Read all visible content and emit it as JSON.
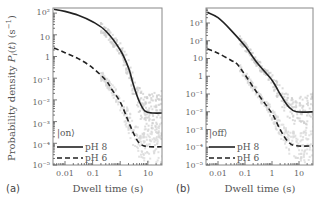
{
  "figure": {
    "ylabel": "Probability density P_i(t) (s^-1)",
    "xlabel": "Dwell time (s)"
  },
  "chart_data": [
    {
      "type": "line",
      "panel_label": "(a)",
      "title": "",
      "state_label": "|on⟩",
      "xlabel": "Dwell time (s)",
      "ylabel": "Probability density P_i(t) (s^-1)",
      "xscale": "log",
      "yscale": "log",
      "xlim": [
        0.004,
        40
      ],
      "ylim": [
        1e-05,
        180
      ],
      "xticks": [
        "0.01",
        "0.1",
        "1",
        "10"
      ],
      "yticks": [
        "10^2",
        "10",
        "1",
        "10^-1",
        "10^-2",
        "10^-3",
        "10^-4",
        "10^-5"
      ],
      "grid": false,
      "legend": {
        "position": "lower left",
        "entries": [
          "pH 8",
          "pH 6"
        ]
      },
      "series": [
        {
          "name": "pH 8",
          "style": "solid",
          "x": [
            0.004,
            0.01,
            0.03,
            0.1,
            0.3,
            1,
            2,
            3,
            5,
            8,
            15,
            40
          ],
          "y": [
            150,
            120,
            80,
            40,
            15,
            2,
            0.3,
            0.05,
            0.008,
            0.003,
            0.0025,
            0.0025
          ]
        },
        {
          "name": "pH 6",
          "style": "dashed",
          "x": [
            0.004,
            0.01,
            0.03,
            0.1,
            0.3,
            0.5,
            1,
            2,
            3,
            5,
            10,
            40
          ],
          "y": [
            2.5,
            1.5,
            0.8,
            0.3,
            0.08,
            0.03,
            0.008,
            0.001,
            0.0003,
            0.0001,
            7e-05,
            7e-05
          ]
        }
      ],
      "scatter": "gray experimental points clustered around both curves from ~0.5 s to 40 s"
    },
    {
      "type": "line",
      "panel_label": "(b)",
      "title": "",
      "state_label": "|off⟩",
      "xlabel": "Dwell time (s)",
      "ylabel": "",
      "xscale": "log",
      "yscale": "log",
      "xlim": [
        0.004,
        40
      ],
      "ylim": [
        1e-05,
        7000
      ],
      "xticks": [
        "0.01",
        "0.1",
        "1",
        "10"
      ],
      "yticks": [
        "10^3",
        "10^2",
        "10",
        "1",
        "10^-1",
        "10^-2",
        "10^-3",
        "10^-4",
        "10^-5"
      ],
      "grid": false,
      "legend": {
        "position": "lower left",
        "entries": [
          "pH 8",
          "pH 6"
        ]
      },
      "series": [
        {
          "name": "pH 8",
          "style": "solid",
          "x": [
            0.004,
            0.01,
            0.03,
            0.1,
            0.3,
            1,
            2,
            4,
            8,
            40
          ],
          "y": [
            4000,
            2000,
            400,
            50,
            5,
            0.6,
            0.1,
            0.02,
            0.01,
            0.01
          ]
        },
        {
          "name": "pH 6",
          "style": "dashed",
          "x": [
            0.004,
            0.01,
            0.03,
            0.05,
            0.1,
            0.3,
            1,
            2,
            4,
            8,
            40
          ],
          "y": [
            35,
            20,
            8,
            5,
            1.2,
            0.1,
            0.008,
            0.001,
            0.0002,
            0.00012,
            0.00012
          ]
        }
      ],
      "scatter": "gray experimental points clustered around both curves from ~0.1 s to 40 s"
    }
  ],
  "panels": {
    "a": {
      "label": "(a)",
      "state": "|on⟩",
      "legend": [
        "pH 8",
        "pH 6"
      ],
      "xticks": [
        "0.01",
        "0.1",
        "1",
        "10"
      ],
      "yticks": [
        "10²",
        "10",
        "1",
        "10⁻¹",
        "10⁻²",
        "10⁻³",
        "10⁻⁴",
        "10⁻⁵"
      ]
    },
    "b": {
      "label": "(b)",
      "state": "|off⟩",
      "legend": [
        "pH 8",
        "pH 6"
      ],
      "xticks": [
        "0.01",
        "0.1",
        "1",
        "10"
      ],
      "yticks": [
        "10³",
        "10²",
        "10",
        "1",
        "10⁻¹",
        "10⁻²",
        "10⁻³",
        "10⁻⁴",
        "10⁻⁵"
      ]
    }
  }
}
